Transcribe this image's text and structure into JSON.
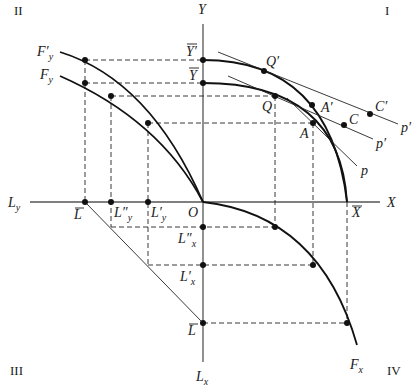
{
  "quadrants": {
    "q1": "I",
    "q2": "II",
    "q3": "III",
    "q4": "IV"
  },
  "axes": {
    "y_top": "Y",
    "x_right": "X",
    "l_y_left": "L",
    "l_y_left_sub": "y",
    "l_x_bottom": "L",
    "l_x_bottom_sub": "x",
    "origin": "O"
  },
  "curves": {
    "f_y_prime": "F′",
    "f_y_prime_sub": "y",
    "f_y": "F",
    "f_y_sub": "y",
    "f_x": "F",
    "f_x_sub": "x"
  },
  "points": {
    "y_bar_prime": "Y′",
    "y_bar": "Y",
    "x_bar": "X",
    "l_bar_left": "L",
    "l_double_prime_y": "L″",
    "l_double_prime_y_sub": "y",
    "l_prime_y": "L′",
    "l_prime_y_sub": "y",
    "l_double_prime_x": "L″",
    "l_double_prime_x_sub": "x",
    "l_prime_x": "L′",
    "l_prime_x_sub": "x",
    "l_bar_bottom": "L",
    "q_prime": "Q′",
    "q": "Q",
    "a_prime": "A′",
    "a": "A",
    "c": "C",
    "c_prime": "C′"
  },
  "price_lines": {
    "p": "p",
    "p_prime_1": "p′",
    "p_prime_2": "p′"
  }
}
